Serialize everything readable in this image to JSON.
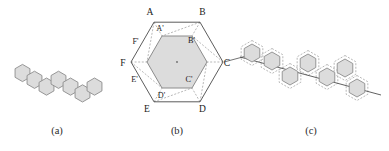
{
  "figure": {
    "panels": [
      {
        "id": "a",
        "caption": "(a)",
        "description": "zigzag polyhex chain of hexagons",
        "hexagon_count": 7
      },
      {
        "id": "b",
        "caption": "(b)",
        "description": "outer hexagon with labeled vertices and inner shaded hexagon",
        "outer_labels": [
          "A",
          "B",
          "C",
          "D",
          "E",
          "F"
        ],
        "inner_labels": [
          "A'",
          "B'",
          "C'",
          "D'",
          "E'",
          "F'"
        ],
        "center_marker": "·"
      },
      {
        "id": "c",
        "caption": "(c)",
        "description": "zigzag chain of hexagons with dashed outlines along a diagonal axis",
        "hexagon_count": 7
      }
    ]
  },
  "colors": {
    "hex_fill": "#dcdcdc",
    "hex_stroke": "#8c8c8c",
    "outline_stroke": "#4a4a4a",
    "dashed_stroke": "#9a9a9a",
    "axis_line": "#4f4f4f",
    "text": "#1a1a1a",
    "background": "#ffffff"
  },
  "panel_a": {
    "hexagons": [
      {
        "cx": 22.5,
        "cy": 73.0
      },
      {
        "cx": 34.5,
        "cy": 79.8
      },
      {
        "cx": 46.5,
        "cy": 86.6
      },
      {
        "cx": 58.5,
        "cy": 79.8
      },
      {
        "cx": 70.5,
        "cy": 86.6
      },
      {
        "cx": 82.5,
        "cy": 93.4
      },
      {
        "cx": 94.5,
        "cy": 86.6
      }
    ],
    "radius": 8.6,
    "caption_x": 57,
    "caption_y": 134
  },
  "panel_b": {
    "outer": {
      "cx": 177,
      "cy": 62,
      "radius": 46,
      "vertices": [
        {
          "label": "A",
          "x": 154.0,
          "y": 22.2,
          "lx": 150.0,
          "ly": 15.0
        },
        {
          "label": "B",
          "x": 200.0,
          "y": 22.2,
          "lx": 202.5,
          "ly": 15.0
        },
        {
          "label": "C",
          "x": 223.0,
          "y": 62.0,
          "lx": 227.0,
          "ly": 65.5
        },
        {
          "label": "D",
          "x": 200.0,
          "y": 101.8,
          "lx": 202.5,
          "ly": 112.0
        },
        {
          "label": "E",
          "x": 154.0,
          "y": 101.8,
          "lx": 147.0,
          "ly": 112.0
        },
        {
          "label": "F",
          "x": 131.0,
          "y": 62.0,
          "lx": 123.0,
          "ly": 65.5
        }
      ]
    },
    "inner": {
      "cx": 177,
      "cy": 62,
      "radius": 30,
      "vertices": [
        {
          "label": "A'",
          "x": 162.0,
          "y": 36.0,
          "lx": 160.0,
          "ly": 31.0
        },
        {
          "label": "B'",
          "x": 192.0,
          "y": 36.0,
          "lx": 191.5,
          "ly": 43.0
        },
        {
          "label": "C'",
          "x": 207.0,
          "y": 62.0,
          "lx": 189.0,
          "ly": 82.0
        },
        {
          "label": "D'",
          "x": 192.0,
          "y": 88.0,
          "lx": 161.5,
          "ly": 98.0
        },
        {
          "label": "E'",
          "x": 162.0,
          "y": 88.0,
          "lx": 134.5,
          "ly": 81.5
        },
        {
          "label": "F'",
          "x": 147.0,
          "y": 62.0,
          "lx": 135.5,
          "ly": 44.0
        }
      ]
    },
    "caption_x": 177,
    "caption_y": 134
  },
  "panel_c": {
    "axis": {
      "x1": 240.0,
      "y1": 57.0,
      "x2": 381.0,
      "y2": 95.0
    },
    "hexagons": [
      {
        "cx": 252.0,
        "cy": 53.0
      },
      {
        "cx": 272.0,
        "cy": 61.0
      },
      {
        "cx": 290.0,
        "cy": 76.0
      },
      {
        "cx": 308.0,
        "cy": 63.0
      },
      {
        "cx": 327.0,
        "cy": 77.0
      },
      {
        "cx": 345.0,
        "cy": 68.0
      },
      {
        "cx": 357.0,
        "cy": 88.0
      }
    ],
    "radius": 9.0,
    "dash_radius": 12.5,
    "connector": {
      "x1": 224.0,
      "y1": 62.0,
      "x2": 252.0,
      "y2": 54.5
    },
    "caption_x": 311,
    "caption_y": 134
  }
}
